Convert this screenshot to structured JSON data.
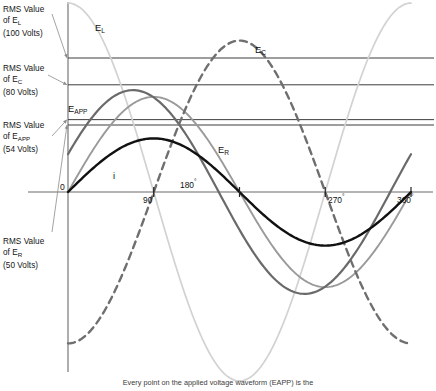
{
  "figure": {
    "caption": "Every point on the applied voltage waveform (EAPP) is the"
  },
  "rms_annotations": [
    {
      "name": "rms-value-el",
      "line1": "RMS Value",
      "line2_pre": "of E",
      "line2_sub": "L",
      "line3": "(100 Volts)",
      "volts": 100
    },
    {
      "name": "rms-value-ec",
      "line1": "RMS Value",
      "line2_pre": "of E",
      "line2_sub": "C",
      "line3": "(80 Volts)",
      "volts": 80
    },
    {
      "name": "rms-value-eapp",
      "line1": "RMS Value",
      "line2_pre": "of E",
      "line2_sub": "APP",
      "line3": "(54 Volts)",
      "volts": 54
    },
    {
      "name": "rms-value-er",
      "line1": "RMS Value",
      "line2_pre": "of E",
      "line2_sub": "R",
      "line3": "(50 Volts)",
      "volts": 50
    }
  ],
  "curve_labels": [
    {
      "name": "curve-label-el",
      "pre": "E",
      "sub": "L"
    },
    {
      "name": "curve-label-ec",
      "pre": "E",
      "sub": "C"
    },
    {
      "name": "curve-label-eapp",
      "pre": "E",
      "sub": "APP"
    },
    {
      "name": "curve-label-er",
      "pre": "E",
      "sub": "R"
    },
    {
      "name": "curve-label-i",
      "pre": "i",
      "sub": ""
    }
  ],
  "axis": {
    "origin_label": "0",
    "ticks": [
      {
        "value": 90,
        "label": "90",
        "degree": "°"
      },
      {
        "value": 180,
        "label": "180",
        "degree": "°"
      },
      {
        "value": 270,
        "label": "270",
        "degree": "°"
      },
      {
        "value": 360,
        "label": "360",
        "degree": "°"
      }
    ]
  },
  "colors": {
    "el": "#d2d2d2",
    "ec": "#6f6f6f",
    "eapp": "#6a6a6a",
    "er": "#9a9a9a",
    "i": "#111111",
    "axis": "#6b6b6b",
    "rms_line": "#3c3c3c",
    "leader": "#8b8b8b"
  },
  "chart_data": {
    "type": "line",
    "title": "",
    "xlabel": "",
    "ylabel": "",
    "xlim": [
      0,
      360
    ],
    "ylim": [
      -145,
      145
    ],
    "xticks": [
      0,
      90,
      180,
      270,
      360
    ],
    "grid": false,
    "legend": "inline-curve-labels",
    "x_unit": "degrees",
    "y_unit": "volts",
    "reference_lines": [
      {
        "label": "RMS Value of EL (100 Volts)",
        "value": 100
      },
      {
        "label": "RMS Value of EC (80 Volts)",
        "value": 80
      },
      {
        "label": "RMS Value of EAPP (54 Volts)",
        "value": 54
      },
      {
        "label": "RMS Value of ER (50 Volts)",
        "value": 50
      }
    ],
    "series": [
      {
        "name": "EL",
        "rms": 100,
        "peak": 141,
        "phase_deg": 90,
        "style": "solid",
        "color": "#d2d2d2",
        "label": "E_L"
      },
      {
        "name": "EC",
        "rms": 80,
        "peak": 113,
        "phase_deg": -90,
        "style": "dashed",
        "color": "#6f6f6f",
        "label": "E_C"
      },
      {
        "name": "EAPP",
        "rms": 54,
        "peak": 76,
        "phase_deg": 21.8,
        "style": "solid",
        "color": "#6a6a6a",
        "label": "E_APP"
      },
      {
        "name": "ER",
        "rms": 50,
        "peak": 71,
        "phase_deg": 0,
        "style": "solid",
        "color": "#9a9a9a",
        "label": "E_R"
      },
      {
        "name": "i",
        "rms": 0,
        "peak": 40,
        "phase_deg": 0,
        "style": "solid",
        "color": "#111111",
        "label": "i"
      }
    ]
  }
}
